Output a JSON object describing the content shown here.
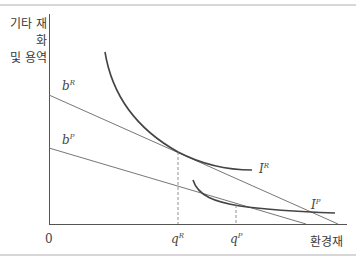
{
  "diagram": {
    "y_axis_label_line1": "기타 재화",
    "y_axis_label_line2": "및 용역",
    "x_axis_label": "환경재",
    "origin_label": "0",
    "budget_lines": [
      {
        "name": "b",
        "superscript": "R"
      },
      {
        "name": "b",
        "superscript": "P"
      }
    ],
    "indifference_curves": [
      {
        "name": "I",
        "superscript": "R"
      },
      {
        "name": "I",
        "superscript": "P"
      }
    ],
    "quantities": [
      {
        "name": "q",
        "superscript": "R"
      },
      {
        "name": "q",
        "superscript": "P"
      }
    ],
    "colors": {
      "axis": "#555555",
      "budget_line": "#666666",
      "curve": "#444444",
      "frame": "#aaaaaa"
    }
  }
}
